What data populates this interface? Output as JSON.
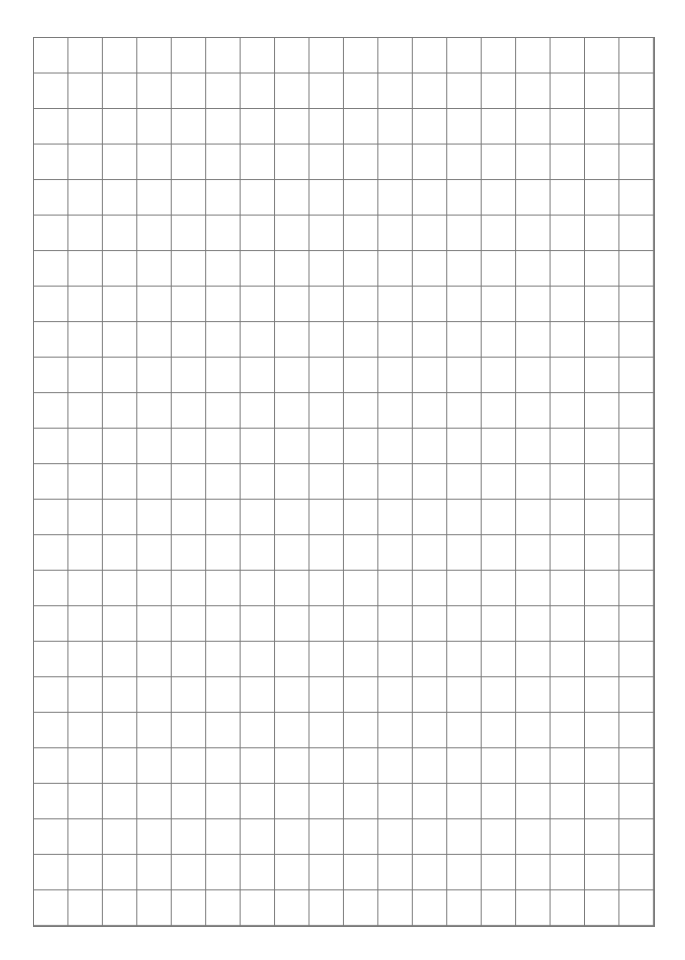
{
  "page": {
    "type": "graph-paper",
    "background": "#ffffff",
    "line_color": "#7a7a7a"
  },
  "grid": {
    "columns": 18,
    "rows": 25,
    "left": 33,
    "top": 37,
    "width": 622,
    "height": 890
  }
}
